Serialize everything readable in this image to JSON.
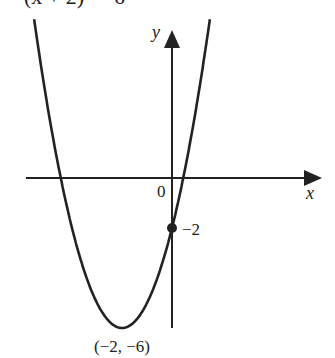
{
  "title": "(x + 2)² − 6",
  "chart_data": {
    "type": "line",
    "title": "(x + 2)² − 6",
    "function": "y = (x + 2)^2 - 6",
    "xlabel": "x",
    "ylabel": "y",
    "origin_label": "0",
    "annotations": [
      {
        "label": "−2",
        "point": [
          0,
          -2
        ],
        "marker": "filled-circle"
      },
      {
        "label": "(−2, −6)",
        "point": [
          -2,
          -6
        ],
        "marker": "none"
      }
    ],
    "x": [
      -5.5,
      -5,
      -4.449,
      -4,
      -3,
      -2,
      -1,
      0,
      0.449,
      1,
      1.5
    ],
    "values": [
      6.25,
      3,
      0,
      -2,
      -5,
      -6,
      -5,
      -2,
      0,
      3,
      6.25
    ],
    "xlim": [
      -5.9,
      5.9
    ],
    "ylim": [
      -6,
      6
    ],
    "grid": false,
    "legend": null
  },
  "labels": {
    "x_axis": "x",
    "y_axis": "y",
    "origin": "0",
    "y_intercept": "−2",
    "vertex": "(−2, −6)"
  }
}
